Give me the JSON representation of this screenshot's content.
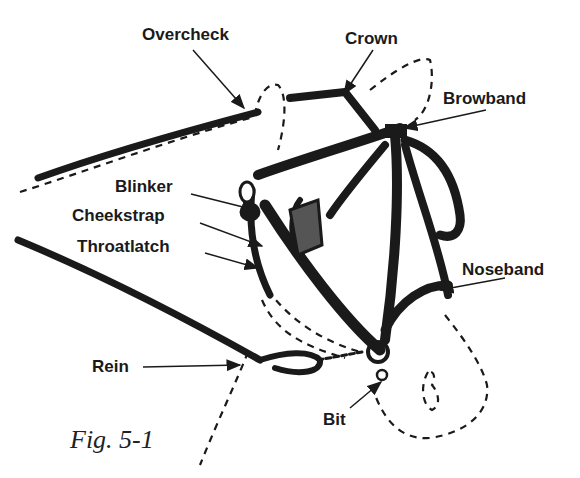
{
  "diagram": {
    "caption": "Fig. 5-1",
    "labels": [
      {
        "id": "overcheck",
        "text": "Overcheck"
      },
      {
        "id": "crown",
        "text": "Crown"
      },
      {
        "id": "browband",
        "text": "Browband"
      },
      {
        "id": "blinker",
        "text": "Blinker"
      },
      {
        "id": "cheekstrap",
        "text": "Cheekstrap"
      },
      {
        "id": "throatlatch",
        "text": "Throatlatch"
      },
      {
        "id": "noseband",
        "text": "Noseband"
      },
      {
        "id": "rein",
        "text": "Rein"
      },
      {
        "id": "bit",
        "text": "Bit"
      }
    ],
    "colors": {
      "ink": "#1a1a1a",
      "background": "#ffffff"
    }
  }
}
